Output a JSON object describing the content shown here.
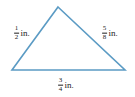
{
  "figure": {
    "type": "triangle-diagram",
    "background_color": "#ffffff",
    "stroke_color": "#5b9bc4",
    "text_color": "#1b1b1b",
    "unit": "in.",
    "vertices": {
      "apex": {
        "x": 58,
        "y": 7
      },
      "bottom_left": {
        "x": 12,
        "y": 70
      },
      "bottom_right": {
        "x": 125,
        "y": 70
      }
    },
    "sides": {
      "left": {
        "numerator": "1",
        "denominator": "2",
        "unit": "in."
      },
      "right": {
        "numerator": "5",
        "denominator": "8",
        "unit": "in."
      },
      "base": {
        "numerator": "3",
        "denominator": "4",
        "unit": "in."
      }
    }
  }
}
